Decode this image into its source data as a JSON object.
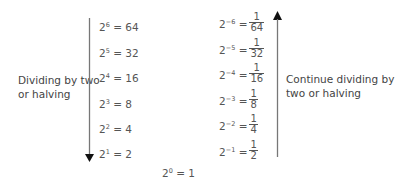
{
  "left": {
    "label_line1": "Dividing by two",
    "label_line2": "or halving",
    "equations": [
      {
        "base": "2",
        "exp": "6",
        "value": "64"
      },
      {
        "base": "2",
        "exp": "5",
        "value": "32"
      },
      {
        "base": "2",
        "exp": "4",
        "value": "16"
      },
      {
        "base": "2",
        "exp": "3",
        "value": "8"
      },
      {
        "base": "2",
        "exp": "2",
        "value": "4"
      },
      {
        "base": "2",
        "exp": "1",
        "value": "2"
      }
    ]
  },
  "center": {
    "base": "2",
    "exp": "0",
    "value": "1"
  },
  "right": {
    "label_line1": "Continue dividing by",
    "label_line2": "two or halving",
    "equations": [
      {
        "base": "2",
        "exp": "−6",
        "num": "1",
        "den": "64"
      },
      {
        "base": "2",
        "exp": "−5",
        "num": "1",
        "den": "32"
      },
      {
        "base": "2",
        "exp": "−4",
        "num": "1",
        "den": "16"
      },
      {
        "base": "2",
        "exp": "−3",
        "num": "1",
        "den": "8"
      },
      {
        "base": "2",
        "exp": "−2",
        "num": "1",
        "den": "4"
      },
      {
        "base": "2",
        "exp": "−1",
        "num": "1",
        "den": "2"
      }
    ]
  },
  "equals": "="
}
